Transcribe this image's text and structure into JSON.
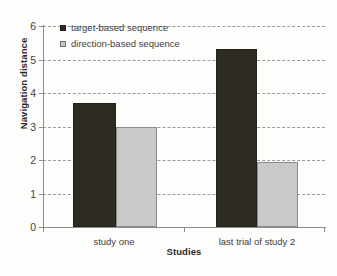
{
  "chart_data": {
    "type": "bar",
    "title": "",
    "xlabel": "Studies",
    "ylabel": "Navigation distance",
    "categories": [
      "study one",
      "last trial of study 2"
    ],
    "series": [
      {
        "name": "target-based sequence",
        "color": "#2e2b22",
        "values": [
          3.7,
          5.3
        ]
      },
      {
        "name": "direction-based sequence",
        "color": "#c9c9c9",
        "values": [
          3.0,
          1.95
        ]
      }
    ],
    "ylim": [
      0,
      6
    ],
    "yticks": [
      0,
      1,
      2,
      3,
      4,
      5,
      6
    ],
    "ytick_labels": [
      "0",
      "1",
      "2",
      "3",
      "4",
      "5",
      "6"
    ],
    "grid": "horizontal-dashed",
    "legend_position": "top-left-inside"
  },
  "axis": {
    "y_title": "Navigation distance",
    "x_title": "Studies",
    "y_ticks": [
      "0",
      "1",
      "2",
      "3",
      "4",
      "5",
      "6"
    ],
    "x_categories": [
      "study one",
      "last trial of study 2"
    ]
  },
  "legend": {
    "items": [
      {
        "label": "target-based sequence",
        "swatch": "legend-swatch-dark"
      },
      {
        "label": "direction-based sequence",
        "swatch": "legend-swatch-light"
      }
    ]
  },
  "colors": {
    "series_target": "#2e2b22",
    "series_direction": "#c9c9c9",
    "axis": "#8d8d8d",
    "grid": "#9a9a9a",
    "text": "#3f3f3f"
  }
}
